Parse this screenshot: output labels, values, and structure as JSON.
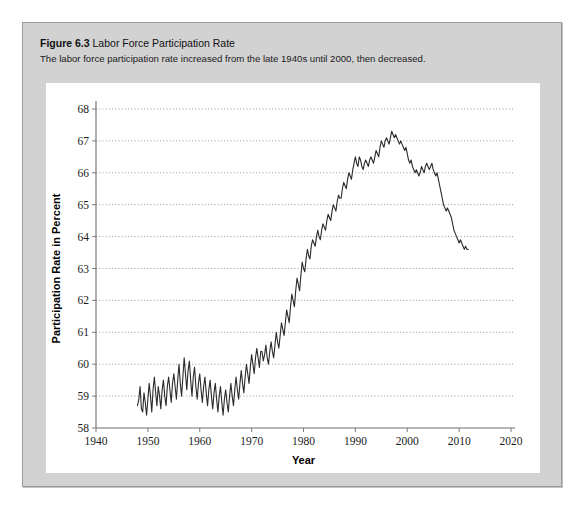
{
  "figure": {
    "number_label": "Figure 6.3",
    "title": "Labor Force Participation Rate",
    "subtitle": "The labor force participation rate increased from the late 1940s until 2000, then decreased."
  },
  "colors": {
    "card_background": "#d2d2d2",
    "card_border": "#9a9a9a",
    "panel_background": "#ffffff",
    "line": "#2b2b2b",
    "gridline": "#8c8c8c",
    "axis": "#6e6e6e",
    "text": "#1a1a1a"
  },
  "chart_data": {
    "type": "line",
    "title": "Labor Force Participation Rate",
    "xlabel": "Year",
    "ylabel": "Participation Rate in Percent",
    "xlim": [
      1940,
      2020
    ],
    "ylim": [
      58,
      68
    ],
    "xticks": [
      1940,
      1950,
      1960,
      1970,
      1980,
      1990,
      2000,
      2010,
      2020
    ],
    "yticks": [
      58,
      59,
      60,
      61,
      62,
      63,
      64,
      65,
      66,
      67,
      68
    ],
    "grid": "horizontal-dotted",
    "legend": "none",
    "series": [
      {
        "name": "Participation Rate in Percent",
        "x_start": 1948.0,
        "x_end": 2013.0,
        "sample_interval_years": 0.25,
        "values": [
          58.7,
          58.9,
          59.3,
          58.6,
          58.5,
          59.1,
          58.8,
          58.4,
          58.9,
          59.4,
          59.0,
          58.5,
          59.2,
          59.6,
          59.1,
          58.7,
          59.3,
          59.0,
          58.6,
          59.2,
          59.5,
          59.0,
          58.7,
          59.3,
          59.6,
          59.2,
          58.8,
          59.4,
          59.7,
          59.3,
          58.9,
          59.5,
          60.0,
          59.4,
          59.0,
          59.6,
          60.2,
          59.7,
          59.2,
          59.8,
          60.1,
          59.5,
          59.0,
          59.6,
          59.9,
          59.3,
          58.9,
          59.4,
          59.7,
          59.2,
          58.8,
          59.3,
          59.6,
          59.1,
          58.7,
          59.2,
          59.5,
          59.0,
          58.6,
          59.1,
          59.4,
          58.9,
          58.5,
          59.0,
          59.3,
          58.8,
          58.4,
          58.9,
          59.2,
          58.8,
          58.5,
          59.0,
          59.4,
          59.0,
          58.7,
          59.2,
          59.6,
          59.2,
          58.9,
          59.4,
          59.8,
          59.4,
          59.1,
          59.6,
          60.0,
          59.7,
          59.4,
          59.9,
          60.3,
          60.0,
          59.7,
          60.2,
          60.5,
          60.2,
          59.9,
          60.4,
          60.4,
          60.1,
          60.3,
          60.6,
          60.2,
          60.0,
          60.4,
          60.7,
          60.4,
          60.2,
          60.6,
          61.0,
          60.7,
          60.5,
          60.9,
          61.3,
          61.1,
          60.9,
          61.3,
          61.7,
          61.5,
          61.3,
          61.8,
          62.2,
          62.0,
          61.8,
          62.3,
          62.7,
          62.5,
          62.3,
          62.8,
          63.2,
          63.0,
          62.9,
          63.3,
          63.6,
          63.4,
          63.3,
          63.7,
          63.9,
          63.8,
          63.7,
          64.0,
          64.2,
          64.0,
          63.9,
          64.2,
          64.4,
          64.3,
          64.2,
          64.5,
          64.7,
          64.6,
          64.5,
          64.8,
          65.0,
          64.9,
          64.8,
          65.1,
          65.3,
          65.2,
          65.2,
          65.5,
          65.7,
          65.6,
          65.5,
          65.8,
          66.0,
          65.9,
          65.8,
          66.1,
          66.3,
          66.5,
          66.3,
          66.2,
          66.5,
          66.4,
          66.2,
          66.1,
          66.3,
          66.4,
          66.3,
          66.2,
          66.4,
          66.5,
          66.4,
          66.3,
          66.5,
          66.7,
          66.6,
          66.5,
          66.8,
          67.0,
          66.9,
          66.8,
          67.0,
          67.1,
          67.0,
          66.9,
          67.1,
          67.3,
          67.2,
          67.1,
          67.2,
          67.1,
          67.0,
          66.9,
          67.0,
          66.9,
          66.8,
          66.7,
          66.8,
          66.6,
          66.4,
          66.3,
          66.4,
          66.2,
          66.1,
          66.0,
          66.1,
          66.0,
          65.9,
          66.0,
          66.2,
          66.1,
          66.0,
          66.2,
          66.3,
          66.2,
          66.1,
          66.2,
          66.3,
          66.1,
          66.0,
          65.9,
          66.0,
          65.8,
          65.6,
          65.4,
          65.2,
          65.0,
          64.9,
          64.8,
          64.9,
          64.8,
          64.7,
          64.6,
          64.4,
          64.2,
          64.1,
          64.0,
          63.9,
          63.8,
          63.9,
          63.8,
          63.7,
          63.6,
          63.7,
          63.6,
          63.6
        ]
      }
    ]
  }
}
